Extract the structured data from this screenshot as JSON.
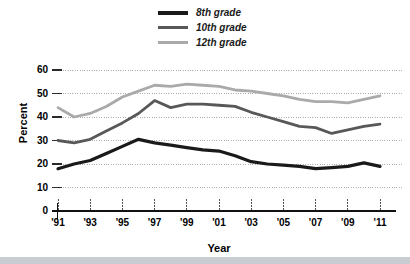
{
  "chart_data": {
    "type": "line",
    "title": "",
    "xlabel": "Year",
    "ylabel": "Percent",
    "xlim": [
      1991,
      2011
    ],
    "ylim": [
      0,
      60
    ],
    "grid": true,
    "legend_position": "top-center",
    "x": [
      1991,
      1992,
      1993,
      1994,
      1995,
      1996,
      1997,
      1998,
      1999,
      2000,
      2001,
      2002,
      2003,
      2004,
      2005,
      2006,
      2007,
      2008,
      2009,
      2010,
      2011
    ],
    "xtick_labels": [
      "'91",
      "'93",
      "'95",
      "'97",
      "'99",
      "'01",
      "'03",
      "'05",
      "'07",
      "'09",
      "'11"
    ],
    "xtick_values": [
      1991,
      1993,
      1995,
      1997,
      1999,
      2001,
      2003,
      2005,
      2007,
      2009,
      2011
    ],
    "ytick_labels": [
      "0",
      "10",
      "20",
      "30",
      "40",
      "50",
      "60"
    ],
    "ytick_values": [
      0,
      10,
      20,
      30,
      40,
      50,
      60
    ],
    "series": [
      {
        "name": "8th grade",
        "color": "#1a1a1a",
        "width": 3.2,
        "values": [
          18,
          20,
          21.5,
          24.5,
          27.5,
          30.5,
          29,
          28,
          27,
          26,
          25.5,
          23.5,
          21,
          20,
          19.5,
          19,
          18,
          18.5,
          19,
          20.5,
          19
        ]
      },
      {
        "name": "10th grade",
        "color": "#585858",
        "width": 2.8,
        "values": [
          30,
          29,
          30.5,
          34,
          37.5,
          41.5,
          47,
          44,
          45.5,
          45.5,
          45,
          44.5,
          42,
          40,
          38,
          36,
          35.5,
          33,
          34.5,
          36,
          37
        ]
      },
      {
        "name": "12th grade",
        "color": "#aaaaaa",
        "width": 2.8,
        "values": [
          44,
          40,
          41.5,
          44.5,
          48.5,
          51,
          53.5,
          53,
          54,
          53.5,
          53,
          51.5,
          51,
          50,
          49,
          47.5,
          46.5,
          46.5,
          46,
          47.5,
          49
        ]
      }
    ]
  },
  "legend": {
    "items": [
      {
        "label": "8th grade",
        "color": "#1a1a1a"
      },
      {
        "label": "10th grade",
        "color": "#585858"
      },
      {
        "label": "12th grade",
        "color": "#aaaaaa"
      }
    ]
  }
}
